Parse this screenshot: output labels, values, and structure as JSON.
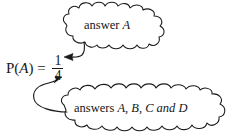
{
  "figure": {
    "type": "annotated-formula-diagram",
    "background_color": "#ffffff",
    "ink_color": "#1a1a1a",
    "formula": {
      "name": "probability-formula",
      "probability_label": "P(",
      "event_variable": "A",
      "probability_label_close": ")",
      "equals": "=",
      "numerator": "1",
      "denominator": "4",
      "plain_text": "P(A) = 1/4"
    },
    "callouts": [
      {
        "id": "numerator-callout",
        "shape": "cloud",
        "points_to": "numerator",
        "text_prefix": "answer ",
        "text_variable": "A",
        "full_text": "answer A"
      },
      {
        "id": "denominator-callout",
        "shape": "cloud",
        "points_to": "denominator",
        "text_prefix": "answers ",
        "text_variables": "A, B, C and D",
        "full_text": "answers A, B, C and D"
      }
    ]
  }
}
